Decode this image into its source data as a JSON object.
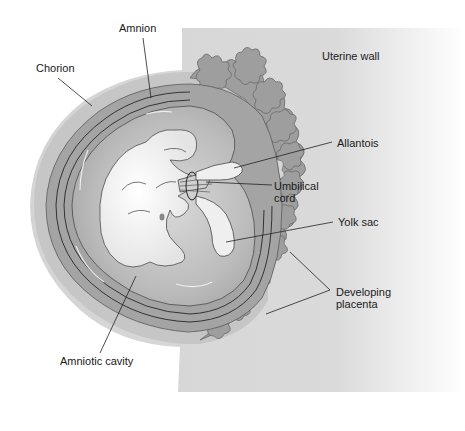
{
  "diagram": {
    "colors": {
      "uterine_wall": "#d6d6d6",
      "placenta_tissue": "#9e9e9e",
      "chorion_band": "#a4a4a4",
      "amniotic_fluid": "#bdbdbd",
      "embryo": "#f2f2f2",
      "outline": "#3a3a3a",
      "label_text": "#1a1a1a"
    },
    "labels": {
      "amnion": "Amnion",
      "chorion": "Chorion",
      "uterine_wall": "Uterine wall",
      "allantois": "Allantois",
      "umbilical_cord_line1": "Umbilical",
      "umbilical_cord_line2": "cord",
      "yolk_sac": "Yolk sac",
      "developing_placenta_line1": "Developing",
      "developing_placenta_line2": "placenta",
      "amniotic_cavity": "Amniotic cavity"
    }
  }
}
